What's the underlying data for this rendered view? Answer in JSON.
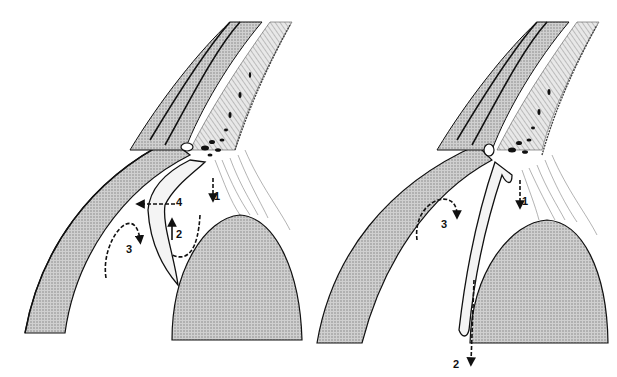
{
  "figure": {
    "panels": [
      {
        "id": "left",
        "description": "Anterior segment cross-section with open posterior chamber space",
        "arrows": [
          {
            "label": "1",
            "direction": "down",
            "location": "ciliary body to lens zonules"
          },
          {
            "label": "2",
            "direction": "up",
            "location": "space behind iris / in front of lens"
          },
          {
            "label": "3",
            "direction": "down (curved)",
            "location": "anterior chamber behind cornea"
          },
          {
            "label": "4",
            "direction": "left",
            "location": "through iris toward anterior chamber"
          }
        ]
      },
      {
        "id": "right",
        "description": "Anterior segment cross-section with iris apposed to lens",
        "arrows": [
          {
            "label": "1",
            "direction": "down",
            "location": "ciliary body to lens zonules"
          },
          {
            "label": "2",
            "direction": "down",
            "location": "along posterior iris past lens"
          },
          {
            "label": "3",
            "direction": "down (curved)",
            "location": "anterior chamber behind cornea"
          }
        ]
      }
    ],
    "colors": {
      "background": "#ffffff",
      "ink": "#111111",
      "stipple_fill": "#b8b8b8",
      "light_tissue": "#e6e6e6"
    }
  }
}
